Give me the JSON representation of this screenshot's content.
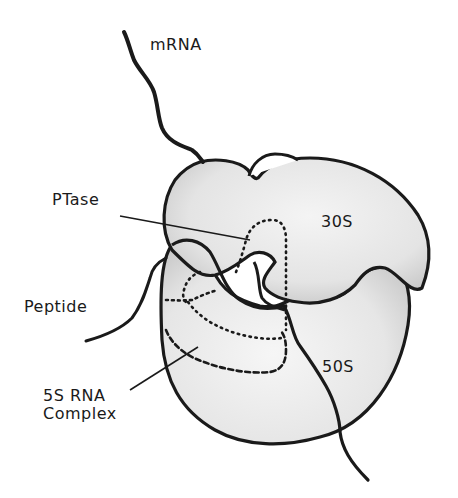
{
  "diagram": {
    "type": "ribosome-schematic",
    "labels": {
      "mrna": "mRNA",
      "ptase": "PTase",
      "subunit_30s": "30S",
      "peptide": "Peptide",
      "subunit_50s": "50S",
      "complex_line1": "5S RNA",
      "complex_line2": "Complex"
    },
    "colors": {
      "outline": "#1a1a1a",
      "fill_shading": "#dcdcdc",
      "fill_light": "#f2f2f2",
      "background": "#ffffff"
    }
  }
}
